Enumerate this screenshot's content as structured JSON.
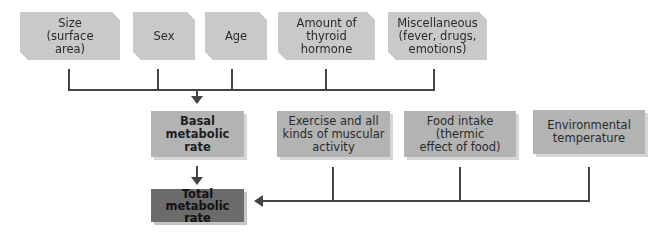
{
  "diagram": {
    "factors_bmr": [
      {
        "id": "size",
        "label": "Size\n(surface\narea)"
      },
      {
        "id": "sex",
        "label": "Sex"
      },
      {
        "id": "age",
        "label": "Age"
      },
      {
        "id": "thyroid",
        "label": "Amount of\nthyroid\nhormone"
      },
      {
        "id": "misc",
        "label": "Miscellaneous\n(fever, drugs,\nemotions)"
      }
    ],
    "basal": {
      "label": "Basal metabolic\nrate"
    },
    "factors_total": [
      {
        "id": "exercise",
        "label": "Exercise and all\nkinds of muscular\nactivity"
      },
      {
        "id": "food",
        "label": "Food intake\n(thermic\neffect of food)"
      },
      {
        "id": "environment",
        "label": "Environmental\ntemperature"
      }
    ],
    "total": {
      "label": "Total metabolic\nrate"
    },
    "colors": {
      "top_box": "#c9c9c9",
      "mid_box": "#b3b3b3",
      "total_box": "#6b6b6b",
      "connector": "#444444"
    }
  }
}
